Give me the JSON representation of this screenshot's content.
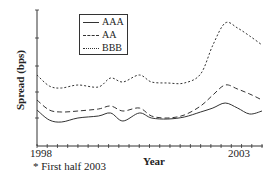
{
  "chart_data": {
    "type": "line",
    "title": "",
    "xlabel": "Year",
    "ylabel": "Spread (bps)",
    "x_tick_labels": [
      "1998",
      "2003"
    ],
    "xlim": [
      1998,
      2003.5
    ],
    "ylim": [
      0,
      136
    ],
    "y_ticks_unlabeled": true,
    "grid": false,
    "legend_position": "upper-left-inside",
    "footnote": "* First half 2003",
    "note_units": "Y axis has no numeric tick labels; values are relative heights above the x-axis (estimated).",
    "x": [
      1998.0,
      1998.3,
      1998.6,
      1999.0,
      1999.5,
      1999.8,
      2000.1,
      2000.5,
      2000.8,
      2001.2,
      2001.6,
      2002.0,
      2002.3,
      2002.6,
      2002.9,
      2003.2,
      2003.5
    ],
    "series": [
      {
        "name": "AAA",
        "style": "solid",
        "values": [
          36,
          26,
          24,
          28,
          30,
          33,
          25,
          33,
          28,
          27,
          29,
          34,
          38,
          43,
          38,
          32,
          35
        ]
      },
      {
        "name": "AA",
        "style": "dashed",
        "values": [
          46,
          36,
          34,
          35,
          37,
          40,
          35,
          38,
          30,
          28,
          31,
          40,
          51,
          61,
          57,
          52,
          46
        ]
      },
      {
        "name": "BBB",
        "style": "dotted",
        "values": [
          71,
          60,
          58,
          61,
          59,
          68,
          64,
          71,
          64,
          63,
          63,
          72,
          101,
          123,
          118,
          110,
          101
        ]
      }
    ]
  },
  "legend": {
    "items": [
      {
        "label": "AAA",
        "style": "solid"
      },
      {
        "label": "AA",
        "style": "dashed"
      },
      {
        "label": "BBB",
        "style": "dotted"
      }
    ]
  },
  "labels": {
    "ylabel": "Spread (bps)",
    "xlabel": "Year",
    "tick_start": "1998",
    "tick_end": "2003",
    "footnote": "* First half 2003"
  }
}
